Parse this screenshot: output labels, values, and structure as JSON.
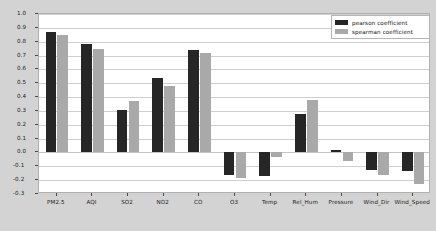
{
  "chart_data": {
    "type": "bar",
    "title": "",
    "xlabel": "",
    "ylabel": "",
    "ylim": [
      -0.3,
      1.0
    ],
    "ytick_step": 0.1,
    "grid": true,
    "legend_position": "upper right",
    "categories": [
      "PM2.5",
      "AQI",
      "SO2",
      "NO2",
      "CO",
      "O3",
      "Temp",
      "Rel_Hum",
      "Pressure",
      "Wind_Dir",
      "Wind_Speed"
    ],
    "yticks": [
      "1.0",
      "0.9",
      "0.8",
      "0.7",
      "0.6",
      "0.5",
      "0.4",
      "0.3",
      "0.2",
      "0.1",
      "0.0",
      "-0.1",
      "-0.2",
      "-0.3"
    ],
    "series": [
      {
        "name": "pearson coefficient",
        "color": "#262626",
        "values": [
          0.87,
          0.78,
          0.31,
          0.535,
          0.74,
          -0.16,
          -0.17,
          0.28,
          0.015,
          -0.13,
          -0.135
        ]
      },
      {
        "name": "spearman coefficient",
        "color": "#a9a9a9",
        "values": [
          0.845,
          0.75,
          0.37,
          0.48,
          0.72,
          -0.185,
          -0.035,
          0.38,
          -0.06,
          -0.165,
          -0.225
        ]
      }
    ]
  },
  "legend": {
    "entries": [
      {
        "label": "pearson coefficient"
      },
      {
        "label": "spearman coefficient"
      }
    ]
  },
  "colors": {
    "pearson": "#262626",
    "spearman": "#a9a9a9",
    "figure_background": "#d3d3d3",
    "axes_background": "#ffffff",
    "grid": "#cfcfcf"
  }
}
